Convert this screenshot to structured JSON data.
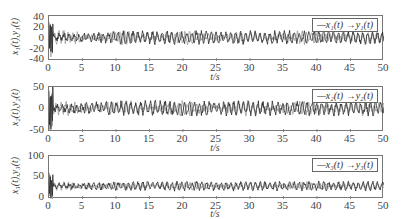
{
  "chart_data": [
    {
      "type": "line",
      "title": "",
      "xlabel": "t/s",
      "ylabel": "x1(t), y1(t)",
      "xlim": [
        0,
        50
      ],
      "ylim": [
        -40,
        40
      ],
      "x_ticks": [
        "0",
        "5",
        "10",
        "15",
        "20",
        "25",
        "30",
        "35",
        "40",
        "45",
        "50"
      ],
      "y_ticks": [
        "40",
        "20",
        "0",
        "-20",
        "-40"
      ],
      "legend": [
        "—x1(t)",
        "→y1(t)"
      ],
      "legend_position": "upper right",
      "grid": false,
      "series": [
        {
          "name": "x1(t)",
          "color": "#222222",
          "description": "chaotic oscillation; initial transient to ~30 at t≈0, then oscillates roughly between -15 and 15"
        },
        {
          "name": "y1(t)",
          "color": "#999999",
          "description": "synchronizing response; oscillates roughly between -10 and 20, converging to x1(t) over time"
        }
      ]
    },
    {
      "type": "line",
      "title": "",
      "xlabel": "t/s",
      "ylabel": "x2(t), y2(t)",
      "xlim": [
        0,
        50
      ],
      "ylim": [
        -50,
        50
      ],
      "x_ticks": [
        "0",
        "5",
        "10",
        "15",
        "20",
        "25",
        "30",
        "35",
        "40",
        "45",
        "50"
      ],
      "y_ticks": [
        "50",
        "0",
        "-50"
      ],
      "legend": [
        "—x2(t)",
        "→y2(t)"
      ],
      "legend_position": "upper right",
      "grid": false,
      "series": [
        {
          "name": "x2(t)",
          "color": "#222222",
          "description": "initial transient ±40 near t=0, then oscillates roughly between -20 and 25"
        },
        {
          "name": "y2(t)",
          "color": "#999999",
          "description": "oscillates roughly between -15 and 25, tracking x2(t)"
        }
      ]
    },
    {
      "type": "line",
      "title": "",
      "xlabel": "t/s",
      "ylabel": "x3(t), y3(t)",
      "xlim": [
        0,
        50
      ],
      "ylim": [
        0,
        100
      ],
      "x_ticks": [
        "0",
        "5",
        "10",
        "15",
        "20",
        "25",
        "30",
        "35",
        "40",
        "45",
        "50"
      ],
      "y_ticks": [
        "100",
        "50",
        "0"
      ],
      "legend": [
        "—x3(t)",
        "→y3(t)"
      ],
      "legend_position": "upper right",
      "grid": false,
      "series": [
        {
          "name": "x3(t)",
          "color": "#222222",
          "description": "initial peak ~60 near t≈0.5, then oscillates roughly between 15 and 45"
        },
        {
          "name": "y3(t)",
          "color": "#999999",
          "description": "oscillates roughly between 20 and 45, tracking x3(t)"
        }
      ]
    }
  ],
  "panels": [
    {
      "ylabel": "x₁(t),y₁(t)",
      "legend": "—x₁(t) →y₁(t)",
      "xlabel": "t/s",
      "yticks": [
        "40",
        "20",
        "0",
        "-20",
        "-40"
      ]
    },
    {
      "ylabel": "x₂(t),y₂(t)",
      "legend": "—x₂(t) →y₂(t)",
      "xlabel": "t/s",
      "yticks": [
        "50",
        "0",
        "-50"
      ]
    },
    {
      "ylabel": "x₃(t),y₃(t)",
      "legend": "—x₃(t) →y₃(t)",
      "xlabel": "t/s",
      "yticks": [
        "100",
        "50",
        "0"
      ]
    }
  ],
  "xticks": [
    "0",
    "5",
    "10",
    "15",
    "20",
    "25",
    "30",
    "35",
    "40",
    "45",
    "50"
  ]
}
